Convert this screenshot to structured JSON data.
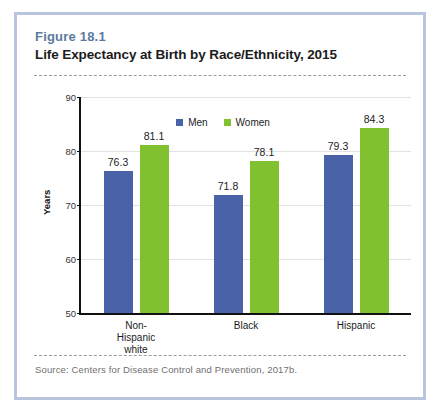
{
  "figure": {
    "number": "Figure 18.1",
    "title": "Life Expectancy at Birth by Race/Ethnicity, 2015",
    "source": "Source: Centers for Disease Control and Prevention, 2017b."
  },
  "colors": {
    "men": "#4a63a8",
    "women": "#81c02e",
    "frame": "#b9c5dd",
    "figure_number": "#5b7a9e",
    "axis": "#111111",
    "gridline": "#e2e2e2"
  },
  "chart_data": {
    "type": "bar",
    "title": "Life Expectancy at Birth by Race/Ethnicity, 2015",
    "xlabel": "",
    "ylabel": "Years",
    "ylim": [
      50,
      90
    ],
    "yticks": [
      50,
      60,
      70,
      80,
      90
    ],
    "ytick_labels": [
      "50",
      "60",
      "70",
      "80",
      "90"
    ],
    "grid": true,
    "legend_position": "top-center",
    "categories": [
      "Non-Hispanic\nwhite",
      "Black",
      "Hispanic"
    ],
    "series": [
      {
        "name": "Men",
        "color": "#4a63a8",
        "values": [
          76.3,
          71.8,
          79.3
        ]
      },
      {
        "name": "Women",
        "color": "#81c02e",
        "values": [
          81.1,
          78.1,
          84.3
        ]
      }
    ],
    "data_labels": [
      {
        "category": "Non-Hispanic white",
        "men": "76.3",
        "women": "81.1"
      },
      {
        "category": "Black",
        "men": "71.8",
        "women": "78.1"
      },
      {
        "category": "Hispanic",
        "men": "79.3",
        "women": "84.3"
      }
    ]
  }
}
